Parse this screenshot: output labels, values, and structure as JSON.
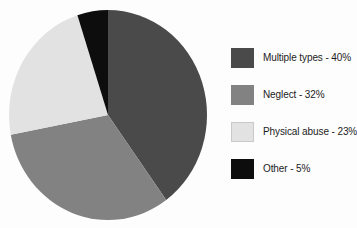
{
  "chart_data": {
    "type": "pie",
    "title": "",
    "subtitle": "",
    "xlabel": "",
    "ylabel": "",
    "legend_position": "right",
    "grid": false,
    "categories": [
      "Multiple types",
      "Neglect",
      "Physical abuse",
      "Other"
    ],
    "values": [
      40,
      32,
      23,
      5
    ],
    "value_unit": "%",
    "slices": [
      {
        "label": "Multiple types",
        "value": 40,
        "value_text": "40%",
        "legend_text": "Multiple types - 40%",
        "color": "#4a4a4a",
        "start_angle_deg": 0,
        "end_angle_deg": 144
      },
      {
        "label": "Neglect",
        "value": 32,
        "value_text": "32%",
        "legend_text": "Neglect - 32%",
        "color": "#828282",
        "start_angle_deg": 144,
        "end_angle_deg": 259.2
      },
      {
        "label": "Physical abuse",
        "value": 23,
        "value_text": "23%",
        "legend_text": "Physical abuse - 23%",
        "color": "#e2e2e2",
        "start_angle_deg": 259.2,
        "end_angle_deg": 342
      },
      {
        "label": "Other",
        "value": 5,
        "value_text": "5%",
        "legend_text": "Other - 5%",
        "color": "#0d0d0d",
        "start_angle_deg": 342,
        "end_angle_deg": 360
      }
    ],
    "geometry": {
      "center_x": 108,
      "center_y": 115,
      "radius_x": 99,
      "radius_y": 105,
      "start_at_twelve_oclock": true,
      "direction": "clockwise"
    }
  },
  "legend": {
    "items": [
      {
        "text": "Multiple types - 40%",
        "color": "#4a4a4a"
      },
      {
        "text": "Neglect - 32%",
        "color": "#828282"
      },
      {
        "text": "Physical abuse - 23%",
        "color": "#e2e2e2"
      },
      {
        "text": "Other - 5%",
        "color": "#0d0d0d"
      }
    ]
  }
}
